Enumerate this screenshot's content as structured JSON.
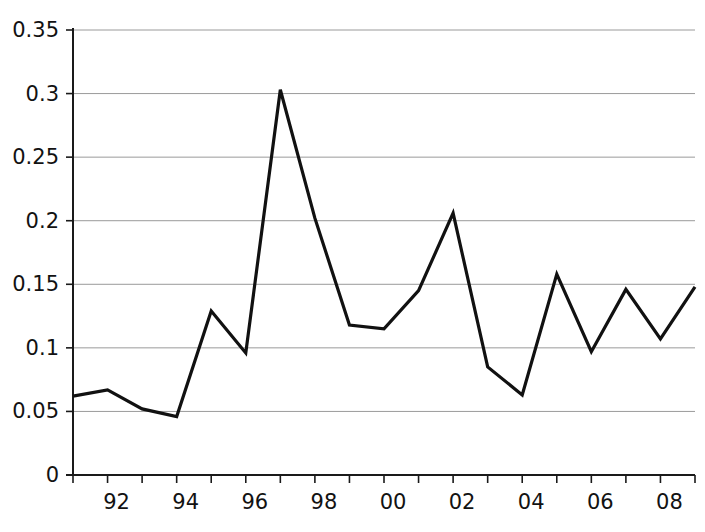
{
  "chart_data": {
    "type": "line",
    "title": "",
    "subtitle": "",
    "xlabel": "",
    "ylabel": "",
    "grid": "horizontal",
    "legend": "none",
    "xlim": [
      1991,
      2009
    ],
    "ylim": [
      0,
      0.35
    ],
    "x": [
      1991,
      1992,
      1993,
      1994,
      1995,
      1996,
      1997,
      1998,
      1999,
      2000,
      2001,
      2002,
      2003,
      2004,
      2005,
      2006,
      2007,
      2008,
      2009
    ],
    "values": [
      0.062,
      0.067,
      0.052,
      0.046,
      0.129,
      0.096,
      0.303,
      0.202,
      0.118,
      0.115,
      0.145,
      0.206,
      0.085,
      0.063,
      0.158,
      0.097,
      0.146,
      0.107,
      0.148
    ],
    "series": [
      {
        "name": "series-1",
        "color": "#111111",
        "values": [
          0.062,
          0.067,
          0.052,
          0.046,
          0.129,
          0.096,
          0.303,
          0.202,
          0.118,
          0.115,
          0.145,
          0.206,
          0.085,
          0.063,
          0.158,
          0.097,
          0.146,
          0.107,
          0.148
        ]
      }
    ],
    "y_ticks": [
      0,
      0.05,
      0.1,
      0.15,
      0.2,
      0.25,
      0.3,
      0.35
    ],
    "y_tick_labels": [
      "0",
      "0.05",
      "0.1",
      "0.15",
      "0.2",
      "0.25",
      "0.3",
      "0.35"
    ],
    "x_ticks": [
      1992,
      1994,
      1996,
      1998,
      2000,
      2002,
      2004,
      2006,
      2008
    ],
    "x_tick_labels": [
      "92",
      "94",
      "96",
      "98",
      "00",
      "02",
      "04",
      "06",
      "08"
    ],
    "colors": {
      "line": "#111111",
      "grid": "#9a9a9a",
      "axis": "#1a1a1a",
      "text": "#121212",
      "background": "#ffffff"
    }
  }
}
